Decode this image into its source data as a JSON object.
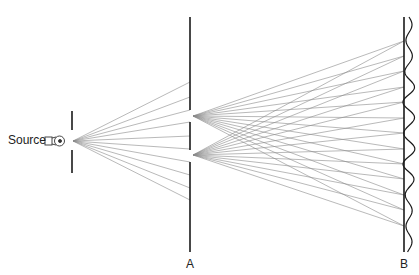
{
  "diagram": {
    "type": "double-slit interference",
    "labels": {
      "source": "Source",
      "barrier_a": "A",
      "barrier_b": "B"
    },
    "colors": {
      "barrier": "#1a1a1a",
      "ray": "#8a8a8a",
      "text": "#222222"
    },
    "source_point": [
      73,
      141
    ],
    "source_barrier": {
      "x": 72,
      "top": [
        111,
        130
      ],
      "bottom": [
        150,
        173
      ]
    },
    "barrier_a": {
      "x": 190,
      "y_range": [
        17,
        252
      ],
      "slits": [
        [
          110,
          122
        ],
        [
          150,
          162
        ]
      ]
    },
    "barrier_b": {
      "x": 404,
      "y_range": [
        17,
        252
      ]
    },
    "rays_to_a_y": [
      82,
      97,
      110,
      122,
      136,
      149,
      162,
      175,
      188,
      200
    ],
    "slit_origins": [
      [
        193,
        116
      ],
      [
        193,
        155
      ]
    ],
    "rays_to_b_y": [
      41,
      56,
      71,
      87,
      102,
      118,
      133,
      149,
      164,
      179,
      195,
      210,
      226
    ]
  }
}
